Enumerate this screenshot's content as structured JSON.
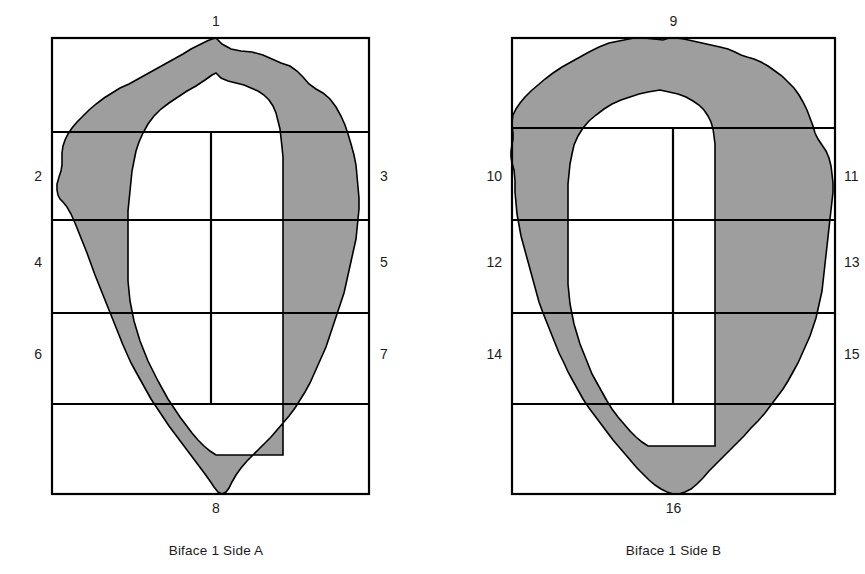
{
  "document": {
    "type": "archaeological-figure",
    "description": "Two line drawings of a bifacial stone tool showing segment numbering grids"
  },
  "colors": {
    "ink": "#000000",
    "text": "#1b1b1b",
    "cortex_fill": "#9e9e9e",
    "interior_fill": "#ffffff",
    "background": "#ffffff"
  },
  "figures": [
    {
      "id": "figure-a",
      "caption": "Biface 1 Side A",
      "grid": {
        "rows": 5,
        "has_center_vertical": true
      },
      "labels": {
        "top": "1",
        "bottom": "8",
        "left": [
          "2",
          "4",
          "6"
        ],
        "right": [
          "3",
          "5",
          "7"
        ]
      }
    },
    {
      "id": "figure-b",
      "caption": "Biface 1 Side B",
      "grid": {
        "rows": 5,
        "has_center_vertical": true
      },
      "labels": {
        "top": "9",
        "bottom": "16",
        "left": [
          "10",
          "12",
          "14"
        ],
        "right": [
          "11",
          "13",
          "15"
        ]
      }
    }
  ]
}
